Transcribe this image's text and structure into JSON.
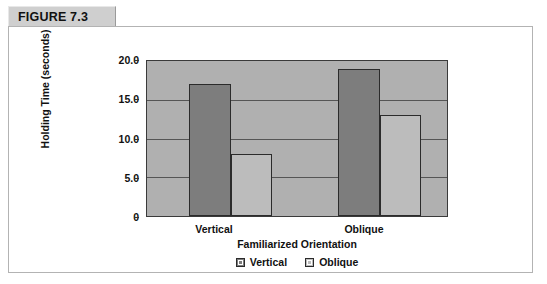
{
  "figure": {
    "label": "FIGURE 7.3"
  },
  "chart_data": {
    "type": "bar",
    "title": "",
    "xlabel": "Familiarized Orientation",
    "ylabel": "Holding Time (seconds)",
    "categories": [
      "Vertical",
      "Oblique"
    ],
    "series": [
      {
        "name": "Vertical",
        "color": "#7d7d7d",
        "values": [
          17.0,
          19.0
        ]
      },
      {
        "name": "Oblique",
        "color": "#bcbcbc",
        "values": [
          8.0,
          13.0
        ]
      }
    ],
    "ylim": [
      0,
      20
    ],
    "yticks": [
      0,
      5,
      10,
      15,
      20
    ],
    "ytick_labels": [
      "0",
      "5.0",
      "10.0",
      "15.0",
      "20.0"
    ],
    "grid": true,
    "legend_position": "bottom",
    "legend": [
      "Vertical",
      "Oblique"
    ],
    "plot_background": "#b0b0b0"
  }
}
